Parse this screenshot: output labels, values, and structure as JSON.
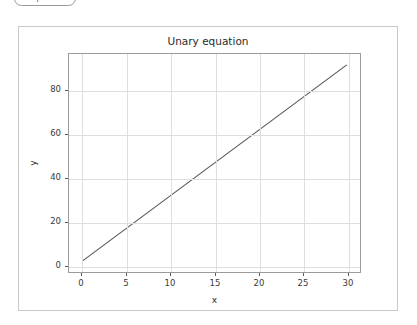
{
  "badge": {
    "label": "matplotlib"
  },
  "figure": {
    "title": "Unary equation",
    "background_color": "#ffffff",
    "border_color": "#c9c9c9"
  },
  "chart_data": {
    "type": "line",
    "title": "Unary equation",
    "xlabel": "x",
    "ylabel": "y",
    "grid": true,
    "legend": null,
    "line_color": "#555555",
    "grid_color": "#dedede",
    "xlim": [
      -1.5,
      31.5
    ],
    "ylim": [
      -3.0,
      97.0
    ],
    "xticks": [
      0,
      5,
      10,
      15,
      20,
      25,
      30
    ],
    "yticks": [
      0,
      20,
      40,
      60,
      80
    ],
    "xticklabels": [
      "0",
      "5",
      "10",
      "15",
      "20",
      "25",
      "30"
    ],
    "yticklabels": [
      "0",
      "20",
      "40",
      "60",
      "80"
    ],
    "series": [
      {
        "name": "y = 3x + 2",
        "x": [
          0,
          30
        ],
        "values": [
          2,
          92
        ]
      }
    ]
  }
}
